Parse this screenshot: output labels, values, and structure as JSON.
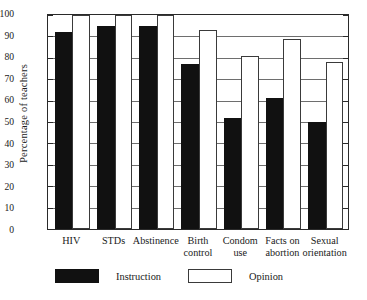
{
  "chart_data": {
    "type": "bar",
    "title": "",
    "subtitle": "",
    "xlabel": "",
    "ylabel": "Percentage of teachers",
    "ylim": [
      0,
      100
    ],
    "ytick_step": 10,
    "yticks": [
      0,
      10,
      20,
      30,
      40,
      50,
      60,
      70,
      80,
      90,
      100
    ],
    "grid": true,
    "grid_orientation": "horizontal",
    "legend_position": "bottom",
    "categories": [
      "HIV",
      "STDs",
      "Abstinence",
      "Birth control",
      "Condom use",
      "Facts on abortion",
      "Sexual orientation"
    ],
    "category_lines": [
      [
        "HIV"
      ],
      [
        "STDs"
      ],
      [
        "Abstinence"
      ],
      [
        "Birth",
        "control"
      ],
      [
        "Condom",
        "use"
      ],
      [
        "Facts on",
        "abortion"
      ],
      [
        "Sexual",
        "orientation"
      ]
    ],
    "series": [
      {
        "name": "Instruction",
        "color": "#111111",
        "values": [
          92,
          95,
          95,
          77,
          52,
          61,
          50
        ]
      },
      {
        "name": "Opinion",
        "color": "#ffffff",
        "values": [
          100,
          100,
          100,
          93,
          81,
          89,
          78
        ]
      }
    ]
  },
  "legend": {
    "items": [
      {
        "label": "Instruction",
        "swatch": "filled-black-swatch"
      },
      {
        "label": "Opinion",
        "swatch": "outlined-white-swatch"
      }
    ]
  },
  "colors": {
    "instruction": "#111111",
    "opinion": "#ffffff",
    "axis": "#2a2a2a",
    "gridline": "#6e6e6e",
    "background": "#ffffff"
  }
}
